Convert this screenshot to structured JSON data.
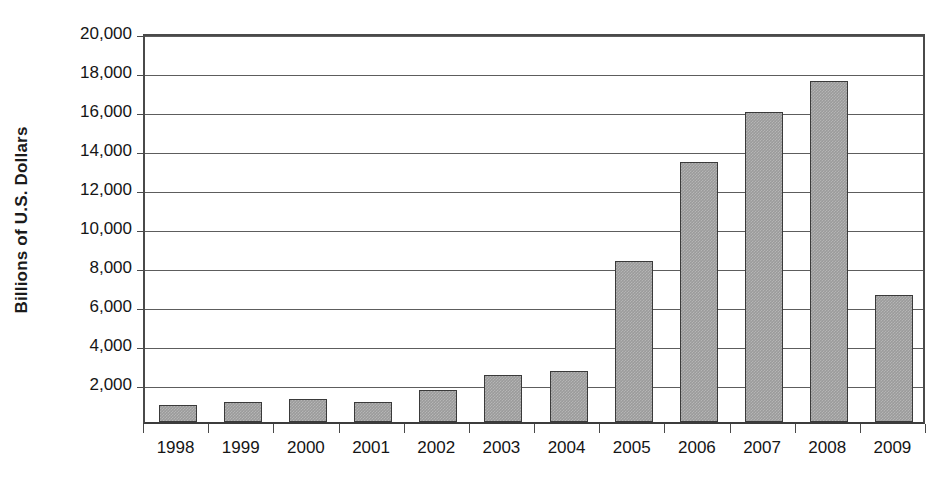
{
  "chart_data": {
    "type": "bar",
    "title": "",
    "subtitle": "",
    "xlabel": "",
    "ylabel": "Billions of U.S. Dollars",
    "categories": [
      "1998",
      "1999",
      "2000",
      "2001",
      "2002",
      "2003",
      "2004",
      "2005",
      "2006",
      "2007",
      "2008",
      "2009"
    ],
    "values": [
      880,
      1030,
      1180,
      1050,
      1650,
      2400,
      2600,
      8250,
      13350,
      15900,
      17500,
      6500
    ],
    "series": [
      {
        "name": "Billions of U.S. Dollars",
        "values": [
          880,
          1030,
          1180,
          1050,
          1650,
          2400,
          2600,
          8250,
          13350,
          15900,
          17500,
          6500
        ]
      }
    ],
    "ylim": [
      0,
      20000
    ],
    "y_ticks": [
      2000,
      4000,
      6000,
      8000,
      10000,
      12000,
      14000,
      16000,
      18000,
      20000
    ],
    "y_tick_labels": [
      "2,000",
      "4,000",
      "6,000",
      "8,000",
      "10,000",
      "12,000",
      "14,000",
      "16,000",
      "18,000",
      "20,000"
    ],
    "grid": true,
    "legend": "none",
    "bar_color": "#9b9b9b",
    "bar_border_color": "#3a3a3a",
    "axis_color": "#4a4a4a",
    "gridline_color": "#5d5d5d",
    "background_color": "#ffffff"
  }
}
